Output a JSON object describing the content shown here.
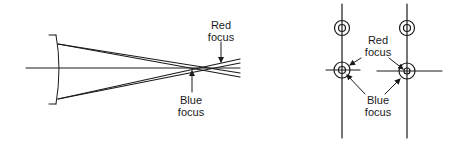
{
  "diagram": {
    "colors": {
      "ink": "#1a1a1a",
      "background": "#ffffff"
    },
    "left_panel": {
      "description": "Rays through lens converging at two foci along optical axis (chromatic aberration)",
      "labels": {
        "red_focus_line1": "Red",
        "red_focus_line2": "focus",
        "blue_focus_line1": "Blue",
        "blue_focus_line2": "focus"
      }
    },
    "right_panel": {
      "description": "Two focus image views showing circle patterns with crosshairs",
      "labels": {
        "red_focus_line1": "Red",
        "red_focus_line2": "focus",
        "blue_focus_line1": "Blue",
        "blue_focus_line2": "focus"
      }
    }
  }
}
